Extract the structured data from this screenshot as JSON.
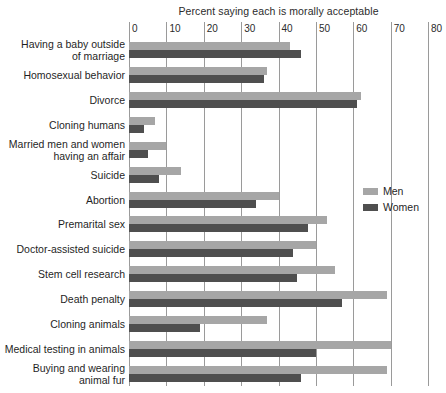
{
  "chart_data": {
    "type": "bar",
    "orientation": "horizontal",
    "title": "Percent saying each is morally acceptable",
    "xlabel": "",
    "ylabel": "",
    "xlim": [
      0,
      80
    ],
    "xticks": [
      0,
      10,
      20,
      30,
      40,
      50,
      60,
      70,
      80
    ],
    "grid": true,
    "legend_position": "middle-right",
    "categories": [
      "Having a baby outside\nof marriage",
      "Homosexual behavior",
      "Divorce",
      "Cloning humans",
      "Married men and women\nhaving an affair",
      "Suicide",
      "Abortion",
      "Premarital sex",
      "Doctor-assisted suicide",
      "Stem cell research",
      "Death penalty",
      "Cloning animals",
      "Medical testing in animals",
      "Buying and wearing\nanimal fur"
    ],
    "series": [
      {
        "name": "Men",
        "color": "#a6a6a6",
        "values": [
          43,
          37,
          62,
          7,
          10,
          14,
          40,
          53,
          50,
          55,
          69,
          37,
          70,
          69
        ]
      },
      {
        "name": "Women",
        "color": "#4f4f4f",
        "values": [
          46,
          36,
          61,
          4,
          5,
          8,
          34,
          48,
          44,
          45,
          57,
          19,
          50,
          46
        ]
      }
    ]
  },
  "legend": {
    "items": [
      {
        "label": "Men",
        "color": "#a6a6a6"
      },
      {
        "label": "Women",
        "color": "#4f4f4f"
      }
    ]
  }
}
